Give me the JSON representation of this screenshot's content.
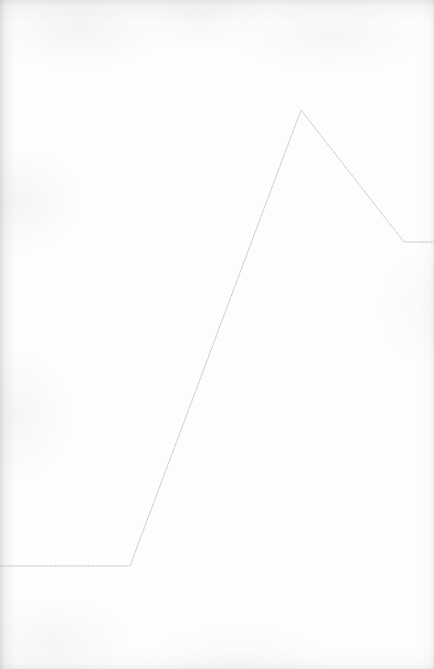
{
  "document": {
    "kind": "scanned-page",
    "width": 434,
    "height": 669,
    "background_color": "#fdfdfd",
    "edge_tint_color": "#92949a",
    "title": "",
    "caption": ""
  },
  "chart_data": {
    "type": "line",
    "title": "",
    "subtitle": "",
    "xlabel": "",
    "ylabel": "",
    "grid": false,
    "axes_visible": false,
    "tick_labels_visible": false,
    "legend": false,
    "legend_position": "none",
    "annotations": [],
    "xlim": [
      0,
      434
    ],
    "ylim": [
      0,
      669
    ],
    "y_axis_inverted": true,
    "series": [
      {
        "name": "series-1",
        "style": "dotted",
        "color": "#b9bbc0",
        "line_width": 1,
        "dash_pattern": [
          1,
          1.6
        ],
        "x": [
          0,
          130,
          301,
          404,
          434
        ],
        "y": [
          566,
          566,
          110,
          242,
          242
        ],
        "points": [
          {
            "x": 0,
            "y": 566,
            "role": "left-edge-start"
          },
          {
            "x": 130,
            "y": 566,
            "role": "baseline-knee"
          },
          {
            "x": 301,
            "y": 110,
            "role": "peak"
          },
          {
            "x": 404,
            "y": 242,
            "role": "descent-knee"
          },
          {
            "x": 434,
            "y": 242,
            "role": "right-edge-end"
          }
        ]
      }
    ]
  }
}
